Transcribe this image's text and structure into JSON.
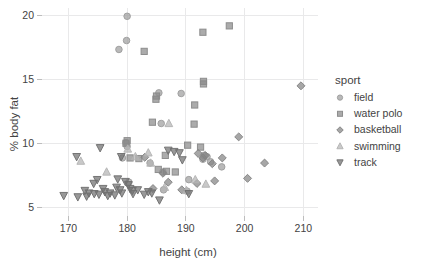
{
  "chart_data": {
    "type": "scatter",
    "title": "",
    "xlabel": "height (cm)",
    "ylabel": "% body fat",
    "xlim": [
      165.5,
      212.5
    ],
    "ylim": [
      4.3,
      20.6
    ],
    "xticks": [
      170,
      180,
      190,
      200,
      210
    ],
    "yticks": [
      5,
      10,
      15,
      20
    ],
    "grid": true,
    "legend": {
      "title": "sport",
      "position": "right",
      "entries": [
        {
          "name": "field",
          "marker": "circle",
          "color": "#9e9e9e"
        },
        {
          "name": "water polo",
          "marker": "square",
          "color": "#8a8a8a"
        },
        {
          "name": "basketball",
          "marker": "diamond",
          "color": "#848484"
        },
        {
          "name": "swimming",
          "marker": "triangle-up",
          "color": "#b4b4b4"
        },
        {
          "name": "track",
          "marker": "triangle-down",
          "color": "#707070"
        }
      ]
    },
    "series": [
      {
        "name": "field",
        "marker": "circle",
        "color": "#9e9e9e",
        "points": [
          [
            180.0,
            19.95
          ],
          [
            179.9,
            18.05
          ],
          [
            178.6,
            17.35
          ],
          [
            185.4,
            13.95
          ],
          [
            189.2,
            13.9
          ],
          [
            185.8,
            11.55
          ],
          [
            179.8,
            10.05
          ],
          [
            180.0,
            9.75
          ],
          [
            190.5,
            7.15
          ],
          [
            186.1,
            7.75
          ],
          [
            179.2,
            8.85
          ],
          [
            196.1,
            8.15
          ],
          [
            193.6,
            8.95
          ],
          [
            193.1,
            9.05
          ],
          [
            192.9,
            8.75
          ],
          [
            194.2,
            8.55
          ],
          [
            183.9,
            8.45
          ],
          [
            186.2,
            6.35
          ],
          [
            190.2,
            6.25
          ],
          [
            180.3,
            6.95
          ]
        ]
      },
      {
        "name": "water polo",
        "marker": "square",
        "color": "#8a8a8a",
        "points": [
          [
            197.4,
            19.2
          ],
          [
            192.9,
            18.7
          ],
          [
            182.9,
            17.2
          ],
          [
            193.0,
            14.85
          ],
          [
            193.0,
            14.65
          ],
          [
            185.0,
            13.7
          ],
          [
            184.9,
            13.45
          ],
          [
            191.5,
            13.0
          ],
          [
            191.4,
            11.5
          ],
          [
            184.3,
            11.65
          ],
          [
            180.0,
            10.2
          ],
          [
            179.8,
            10.0
          ],
          [
            186.5,
            9.05
          ],
          [
            190.3,
            9.85
          ],
          [
            180.5,
            8.85
          ],
          [
            186.7,
            7.8
          ],
          [
            188.2,
            7.75
          ],
          [
            185.3,
            7.95
          ],
          [
            182.0,
            8.8
          ],
          [
            192.5,
            9.7
          ]
        ]
      },
      {
        "name": "basketball",
        "marker": "diamond",
        "color": "#848484",
        "points": [
          [
            209.6,
            14.5
          ],
          [
            199.0,
            10.5
          ],
          [
            203.4,
            8.45
          ],
          [
            200.5,
            7.25
          ],
          [
            196.2,
            8.85
          ],
          [
            193.3,
            9.05
          ],
          [
            192.9,
            8.85
          ],
          [
            194.5,
            8.4
          ],
          [
            194.9,
            7.05
          ],
          [
            186.1,
            7.65
          ],
          [
            187.0,
            6.95
          ],
          [
            183.0,
            8.9
          ],
          [
            184.4,
            6.45
          ],
          [
            191.9,
            6.85
          ],
          [
            192.1,
            9.2
          ],
          [
            189.3,
            6.35
          ]
        ]
      },
      {
        "name": "swimming",
        "marker": "triangle-up",
        "color": "#b4b4b4",
        "points": [
          [
            187.1,
            11.55
          ],
          [
            180.1,
            9.55
          ],
          [
            183.6,
            9.25
          ],
          [
            172.1,
            8.6
          ],
          [
            176.5,
            7.75
          ],
          [
            184.0,
            8.45
          ],
          [
            186.4,
            6.55
          ],
          [
            191.6,
            7.15
          ],
          [
            193.4,
            6.8
          ],
          [
            190.1,
            6.3
          ],
          [
            181.4,
            8.95
          ]
        ]
      },
      {
        "name": "track",
        "marker": "triangle-down",
        "color": "#707070",
        "points": [
          [
            175.4,
            9.65
          ],
          [
            171.4,
            8.95
          ],
          [
            179.0,
            8.95
          ],
          [
            187.0,
            9.45
          ],
          [
            188.0,
            9.35
          ],
          [
            188.9,
            9.25
          ],
          [
            189.4,
            8.7
          ],
          [
            174.9,
            7.15
          ],
          [
            174.3,
            6.85
          ],
          [
            179.7,
            7.0
          ],
          [
            180.2,
            6.75
          ],
          [
            178.4,
            7.2
          ],
          [
            173.5,
            6.1
          ],
          [
            174.4,
            6.05
          ],
          [
            176.2,
            6.2
          ],
          [
            176.7,
            5.9
          ],
          [
            179.1,
            6.1
          ],
          [
            180.9,
            6.3
          ],
          [
            181.0,
            6.05
          ],
          [
            182.9,
            6.0
          ],
          [
            184.2,
            6.1
          ],
          [
            185.5,
            5.55
          ],
          [
            169.2,
            5.9
          ],
          [
            171.6,
            5.8
          ],
          [
            173.1,
            5.85
          ],
          [
            177.9,
            5.95
          ],
          [
            175.9,
            6.45
          ],
          [
            178.2,
            6.55
          ],
          [
            180.5,
            6.45
          ],
          [
            183.6,
            6.2
          ],
          [
            190.5,
            6.05
          ],
          [
            178.8,
            6.35
          ],
          [
            172.8,
            6.3
          ],
          [
            181.8,
            6.35
          ],
          [
            177.1,
            6.1
          ],
          [
            175.2,
            6.0
          ]
        ]
      }
    ]
  }
}
